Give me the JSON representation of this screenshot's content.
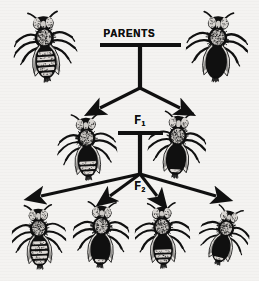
{
  "figure": {
    "title_text": "PARENTS",
    "f1_letter": "F",
    "f1_sub": "1",
    "f2_letter": "F",
    "f2_sub": "2",
    "background_color": "#f4f3f1",
    "ink_color": "#101010"
  },
  "generations": [
    {
      "id": "parents",
      "label": "PARENTS",
      "organisms": [
        {
          "name": "parent-left",
          "phenotype": "light-striped-abdomen",
          "x": 13,
          "y": 10,
          "w": 64,
          "h": 76,
          "rotate": -4,
          "dark": 0.18
        },
        {
          "name": "parent-right",
          "phenotype": "dark-abdomen",
          "x": 186,
          "y": 10,
          "w": 62,
          "h": 76,
          "rotate": 3,
          "dark": 0.88
        }
      ]
    },
    {
      "id": "f1",
      "label": "F1",
      "organisms": [
        {
          "name": "f1-left",
          "phenotype": "intermediate-mottled",
          "x": 57,
          "y": 112,
          "w": 60,
          "h": 72,
          "rotate": -3,
          "dark": 0.42
        },
        {
          "name": "f1-right",
          "phenotype": "intermediate-dark",
          "x": 148,
          "y": 110,
          "w": 58,
          "h": 72,
          "rotate": 4,
          "dark": 0.7
        }
      ]
    },
    {
      "id": "f2",
      "label": "F2",
      "organisms": [
        {
          "name": "f2-1",
          "phenotype": "light-striped-abdomen",
          "x": 12,
          "y": 203,
          "w": 54,
          "h": 70,
          "rotate": -2,
          "dark": 0.2
        },
        {
          "name": "f2-2",
          "phenotype": "dark-abdomen",
          "x": 73,
          "y": 200,
          "w": 56,
          "h": 72,
          "rotate": 2,
          "dark": 0.82
        },
        {
          "name": "f2-3",
          "phenotype": "intermediate-striped",
          "x": 135,
          "y": 201,
          "w": 55,
          "h": 71,
          "rotate": -2,
          "dark": 0.38
        },
        {
          "name": "f2-4",
          "phenotype": "banded-dark-abdomen",
          "x": 199,
          "y": 205,
          "w": 50,
          "h": 64,
          "rotate": 14,
          "dark": 0.72
        }
      ]
    }
  ],
  "connectors": [
    {
      "name": "parents-crossbar",
      "type": "hbar",
      "x1": 100,
      "x2": 181,
      "y": 45
    },
    {
      "name": "parents-stem",
      "type": "vline",
      "x": 140,
      "y1": 45,
      "y2": 88
    },
    {
      "name": "parents-to-f1-left",
      "type": "arrow",
      "x1": 140,
      "y1": 88,
      "x2": 100,
      "y2": 108
    },
    {
      "name": "parents-to-f1-right",
      "type": "arrow",
      "x1": 140,
      "y1": 88,
      "x2": 180,
      "y2": 108
    },
    {
      "name": "f1-crossbar",
      "type": "hbar",
      "x1": 118,
      "x2": 163,
      "y": 133
    },
    {
      "name": "f1-stem",
      "type": "vline",
      "x": 140,
      "y1": 133,
      "y2": 174
    },
    {
      "name": "f1-to-f2-1",
      "type": "arrow",
      "x1": 140,
      "y1": 174,
      "x2": 41,
      "y2": 196
    },
    {
      "name": "f1-to-f2-2",
      "type": "arrow",
      "x1": 140,
      "y1": 174,
      "x2": 110,
      "y2": 196
    },
    {
      "name": "f1-to-f2-3",
      "type": "arrow",
      "x1": 140,
      "y1": 174,
      "x2": 157,
      "y2": 196
    },
    {
      "name": "f1-to-f2-4",
      "type": "arrow",
      "x1": 140,
      "y1": 174,
      "x2": 216,
      "y2": 196
    }
  ]
}
